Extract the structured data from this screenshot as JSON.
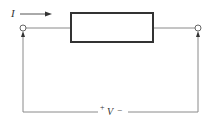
{
  "diagram": {
    "type": "circuit",
    "current_label": "I",
    "voltage_plus": "+",
    "voltage_label": "V",
    "voltage_minus": "−",
    "colors": {
      "wire": "#8a8a8a",
      "box": "#333333",
      "text": "#333333",
      "background": "#ffffff"
    }
  }
}
